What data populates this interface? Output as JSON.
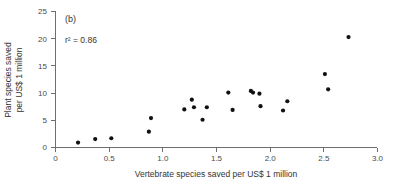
{
  "chart_data": {
    "type": "scatter",
    "title": "",
    "panel_label": "(b)",
    "annotation": "r² = 0.86",
    "annotation_r2_value": 0.86,
    "xlabel": "Vertebrate species saved per US$ 1 million",
    "ylabel": "Plant species saved per US$ 1 million",
    "ylabel_line1": "Plant species saved",
    "ylabel_line2": "per US$ 1 million",
    "xlim": [
      0,
      3.0
    ],
    "ylim": [
      0,
      25
    ],
    "xticks": [
      0,
      0.5,
      1.0,
      1.5,
      2.0,
      2.5,
      3.0
    ],
    "xtick_labels": [
      "0",
      "0.5",
      "1.0",
      "1.5",
      "2.0",
      "2.5",
      "3.0"
    ],
    "yticks": [
      0,
      5,
      10,
      15,
      20,
      25
    ],
    "ytick_labels": [
      "0",
      "5",
      "10",
      "15",
      "20",
      "25"
    ],
    "grid": false,
    "legend": null,
    "marker_color": "#111111",
    "axis_color": "#6e6e6e",
    "points": [
      {
        "x": 0.21,
        "y": 0.9
      },
      {
        "x": 0.37,
        "y": 1.55
      },
      {
        "x": 0.52,
        "y": 1.7
      },
      {
        "x": 0.87,
        "y": 2.9
      },
      {
        "x": 0.89,
        "y": 5.4
      },
      {
        "x": 1.2,
        "y": 7.0
      },
      {
        "x": 1.27,
        "y": 8.8
      },
      {
        "x": 1.29,
        "y": 7.4
      },
      {
        "x": 1.37,
        "y": 5.1
      },
      {
        "x": 1.41,
        "y": 7.4
      },
      {
        "x": 1.61,
        "y": 10.1
      },
      {
        "x": 1.65,
        "y": 6.9
      },
      {
        "x": 1.82,
        "y": 10.4
      },
      {
        "x": 1.84,
        "y": 10.1
      },
      {
        "x": 1.9,
        "y": 9.9
      },
      {
        "x": 1.91,
        "y": 7.6
      },
      {
        "x": 2.12,
        "y": 6.8
      },
      {
        "x": 2.16,
        "y": 8.5
      },
      {
        "x": 2.51,
        "y": 13.5
      },
      {
        "x": 2.54,
        "y": 10.7
      },
      {
        "x": 2.73,
        "y": 20.3
      }
    ]
  }
}
